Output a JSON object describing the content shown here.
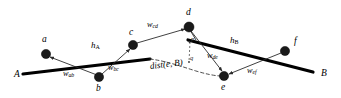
{
  "figure": {
    "colors": {
      "stroke": "#000000",
      "node_fill": "#1a1a1a",
      "thin_edge": "#2b2b2b",
      "dashed": "#3a3a3a",
      "background": "#ffffff"
    },
    "endpoints": [
      {
        "id": "A",
        "label": "A",
        "x": 14,
        "y": 72
      },
      {
        "id": "B",
        "label": "B",
        "x": 321,
        "y": 71
      }
    ],
    "nodes": [
      {
        "id": "a",
        "label": "a",
        "x": 46,
        "y": 54,
        "label_x": 42,
        "label_y": 38
      },
      {
        "id": "b",
        "label": "b",
        "x": 99,
        "y": 77,
        "label_x": 96,
        "label_y": 85
      },
      {
        "id": "c",
        "label": "c",
        "x": 133,
        "y": 45,
        "label_x": 129,
        "label_y": 30
      },
      {
        "id": "d",
        "label": "d",
        "x": 189,
        "y": 27,
        "label_x": 186,
        "label_y": 10
      },
      {
        "id": "e",
        "label": "e",
        "x": 224,
        "y": 76,
        "label_x": 221,
        "label_y": 84
      },
      {
        "id": "f",
        "label": "f",
        "x": 285,
        "y": 51,
        "label_x": 294,
        "label_y": 38
      }
    ],
    "edges": [
      {
        "id": "ab",
        "from": "a",
        "to": "b",
        "weight": "w",
        "weight_sub": "ab",
        "label_x": 68,
        "label_y": 70
      },
      {
        "id": "bc",
        "from": "b",
        "to": "c",
        "weight": "w",
        "weight_sub": "bc",
        "label_x": 112,
        "label_y": 65
      },
      {
        "id": "cd",
        "from": "c",
        "to": "d",
        "weight": "w",
        "weight_sub": "cd",
        "label_x": 150,
        "label_y": 22
      },
      {
        "id": "de",
        "from": "d",
        "to": "e",
        "weight": "w",
        "weight_sub": "de",
        "label_x": 212,
        "label_y": 54
      },
      {
        "id": "ef",
        "from": "e",
        "to": "f",
        "weight": "w",
        "weight_sub": "ef",
        "label_x": 251,
        "label_y": 68
      }
    ],
    "segments": [
      {
        "id": "A",
        "label": "h",
        "label_sub": "A",
        "x1": 23,
        "y1": 74,
        "x2": 150,
        "y2": 59,
        "label_x": 93,
        "label_y": 43
      },
      {
        "id": "B",
        "label": "h",
        "label_sub": "B",
        "x1": 188,
        "y1": 40,
        "x2": 313,
        "y2": 72,
        "label_x": 232,
        "label_y": 38
      }
    ],
    "annotations": [
      {
        "id": "dist",
        "text": "dist(e, B)",
        "x": 152,
        "y": 64
      },
      {
        "id": "p",
        "text": "p",
        "x": 190,
        "y": 38
      },
      {
        "id": "q",
        "text": "q",
        "x": 189,
        "y": 56
      }
    ]
  }
}
